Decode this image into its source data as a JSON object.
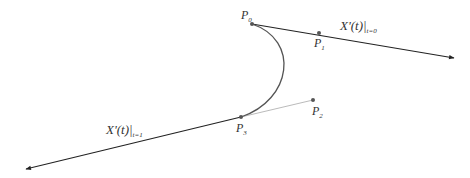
{
  "diagram": {
    "type": "cubic-bezier-tangent-illustration",
    "points": [
      {
        "id": "P0",
        "label": "P",
        "sub": "0",
        "x": 252,
        "y": 24
      },
      {
        "id": "P1",
        "label": "P",
        "sub": "1",
        "x": 319,
        "y": 33
      },
      {
        "id": "P2",
        "label": "P",
        "sub": "2",
        "x": 313,
        "y": 100
      },
      {
        "id": "P3",
        "label": "P",
        "sub": "3",
        "x": 241,
        "y": 117
      }
    ],
    "tangent_top": {
      "main": "X'(t)|",
      "sub": "t=0"
    },
    "tangent_bottom": {
      "main": "X'(t)|",
      "sub": "t=1"
    },
    "colors": {
      "curve": "#555555",
      "tangent": "#222222",
      "control_line": "#bbbbbb",
      "point": "#555555"
    }
  }
}
